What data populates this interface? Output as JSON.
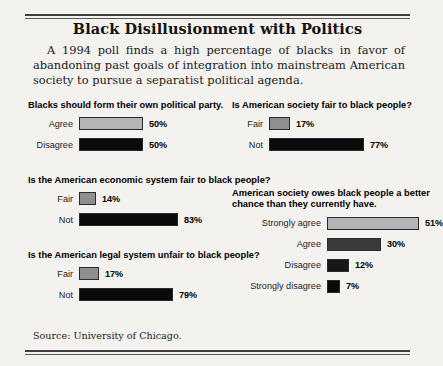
{
  "document": {
    "title": "Black Disillusionment with Politics",
    "intro": "A 1994 poll finds a high percentage of blacks in favor of abandoning past goals of integration into mainstream American society to pursue a separatist political agenda.",
    "source": "Source: University of Chicago.",
    "paper_color": "#f4f2ee",
    "rule_color": "#3d3d3d"
  },
  "palette": {
    "light_gray": "#b5b5b5",
    "mid_gray": "#3a3a3a",
    "near_black": "#0a0a0a",
    "bar_border": "#2a2a2a"
  },
  "chart_data": [
    {
      "id": "political-party",
      "type": "bar",
      "orientation": "horizontal",
      "title": "Blacks should form their own political party.",
      "categories": [
        "Agree",
        "Disagree"
      ],
      "values": [
        50,
        50
      ],
      "labels": [
        "50%",
        "50%"
      ],
      "colors": [
        "#b5b5b5",
        "#0a0a0a"
      ],
      "xlabel": "",
      "ylabel": "",
      "xlim": [
        0,
        100
      ],
      "grid": false,
      "legend": false,
      "units": "percent"
    },
    {
      "id": "economic-system",
      "type": "bar",
      "orientation": "horizontal",
      "title": "Is the American economic system fair to black people?",
      "categories": [
        "Fair",
        "Not"
      ],
      "values": [
        14,
        83
      ],
      "labels": [
        "14%",
        "83%"
      ],
      "colors": [
        "#8f8f8f",
        "#0a0a0a"
      ],
      "xlabel": "",
      "ylabel": "",
      "xlim": [
        0,
        100
      ],
      "grid": false,
      "legend": false,
      "units": "percent"
    },
    {
      "id": "legal-system",
      "type": "bar",
      "orientation": "horizontal",
      "title": "Is the American legal system unfair to black people?",
      "categories": [
        "Fair",
        "Not"
      ],
      "values": [
        17,
        79
      ],
      "labels": [
        "17%",
        "79%"
      ],
      "colors": [
        "#8f8f8f",
        "#0a0a0a"
      ],
      "xlabel": "",
      "ylabel": "",
      "xlim": [
        0,
        100
      ],
      "grid": false,
      "legend": false,
      "units": "percent"
    },
    {
      "id": "society-fair",
      "type": "bar",
      "orientation": "horizontal",
      "title": "Is American society fair to black people?",
      "categories": [
        "Fair",
        "Not"
      ],
      "values": [
        17,
        77
      ],
      "labels": [
        "17%",
        "77%"
      ],
      "colors": [
        "#8f8f8f",
        "#0a0a0a"
      ],
      "xlabel": "",
      "ylabel": "",
      "xlim": [
        0,
        100
      ],
      "grid": false,
      "legend": false,
      "units": "percent"
    },
    {
      "id": "better-chance",
      "type": "bar",
      "orientation": "horizontal",
      "title": "American society owes black people a better chance than they currently have.",
      "categories": [
        "Strongly agree",
        "Agree",
        "Disagree",
        "Strongly disagree"
      ],
      "values": [
        51,
        30,
        12,
        7
      ],
      "labels": [
        "51%",
        "30%",
        "12%",
        "7%"
      ],
      "colors": [
        "#b5b5b5",
        "#3a3a3a",
        "#171717",
        "#0a0a0a"
      ],
      "xlabel": "",
      "ylabel": "",
      "xlim": [
        0,
        100
      ],
      "grid": false,
      "legend": false,
      "units": "percent"
    }
  ]
}
